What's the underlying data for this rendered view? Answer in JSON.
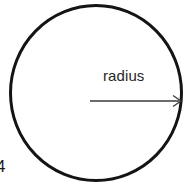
{
  "figure": {
    "type": "geometry-diagram",
    "width": 191,
    "height": 184,
    "background_color": "#ffffff"
  },
  "circle": {
    "name": "circle-outline",
    "center_x": 96,
    "center_y": 93,
    "radius_x": 86,
    "radius_y": 88,
    "stroke_color": "#141414",
    "stroke_width": 3,
    "fill": "none"
  },
  "radius_arrow": {
    "name": "radius-arrow",
    "start_x": 90,
    "start_y": 101,
    "end_x": 181,
    "end_y": 101,
    "stroke_color": "#3a3a3a",
    "stroke_width": 1.2,
    "arrowhead": "open-v",
    "arrowhead_size": 7
  },
  "labels": {
    "radius": "radius",
    "corner_artifact": "4"
  },
  "colors": {
    "ink": "#141414",
    "line": "#3a3a3a",
    "text": "#262626",
    "background": "#ffffff"
  }
}
